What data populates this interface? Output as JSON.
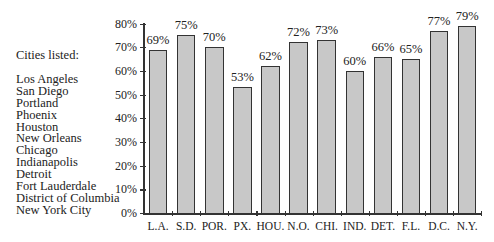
{
  "legend": {
    "title": "Cities listed:",
    "cities": [
      "Los Angeles",
      "San Diego",
      "Portland",
      "Phoenix",
      "Houston",
      "New Orleans",
      "Chicago",
      "Indianapolis",
      "Detroit",
      "Fort Lauderdale",
      "District of Columbia",
      "New York City"
    ]
  },
  "chart_data": {
    "type": "bar",
    "title": "",
    "xlabel": "",
    "ylabel": "",
    "categories": [
      "L.A.",
      "S.D.",
      "POR.",
      "PX.",
      "HOU.",
      "N.O.",
      "CHI.",
      "IND.",
      "DET.",
      "F.L.",
      "D.C.",
      "N.Y."
    ],
    "values": [
      69,
      75,
      70,
      53,
      62,
      72,
      73,
      60,
      66,
      65,
      77,
      79
    ],
    "value_labels": [
      "69%",
      "75%",
      "70%",
      "53%",
      "62%",
      "72%",
      "73%",
      "60%",
      "66%",
      "65%",
      "77%",
      "79%"
    ],
    "yticks": [
      "0%",
      "10%",
      "20%",
      "30%",
      "40%",
      "50%",
      "60%",
      "70%",
      "80%"
    ],
    "ylim": [
      0,
      80
    ],
    "grid": false,
    "legend_position": "left (text list of cities)",
    "bar_color": "#c8c8c8",
    "bar_edge_color": "#333333"
  }
}
